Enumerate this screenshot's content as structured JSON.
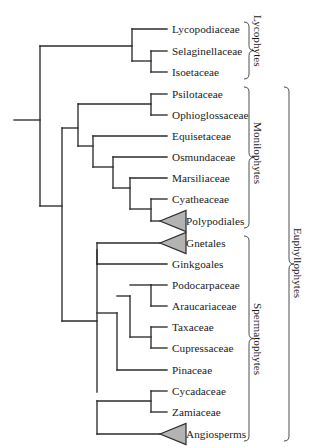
{
  "figure": {
    "type": "phylogenetic-cladogram",
    "background_color": "#ffffff",
    "line_color": "#2b2b2b",
    "triangle_fill": "#b3b3b3",
    "text_color": "#1a1a1a"
  },
  "tips": [
    {
      "label": "Lycopodiaceae",
      "y": 29,
      "x": 167,
      "terminal": "line",
      "clade": "Lycophytes"
    },
    {
      "label": "Selaginellaceae",
      "y": 51,
      "x": 167,
      "terminal": "line",
      "clade": "Lycophytes"
    },
    {
      "label": "Isoetaceae",
      "y": 72,
      "x": 167,
      "terminal": "line",
      "clade": "Lycophytes"
    },
    {
      "label": "Psilotaceae",
      "y": 94,
      "x": 167,
      "terminal": "line",
      "clade": "Monilophytes"
    },
    {
      "label": "Ophioglossaceae",
      "y": 115,
      "x": 167,
      "terminal": "line",
      "clade": "Monilophytes"
    },
    {
      "label": "Equisetaceae",
      "y": 136,
      "x": 167,
      "terminal": "line",
      "clade": "Monilophytes"
    },
    {
      "label": "Osmundaceae",
      "y": 157,
      "x": 167,
      "terminal": "line",
      "clade": "Monilophytes"
    },
    {
      "label": "Marsiliaceae",
      "y": 178,
      "x": 167,
      "terminal": "line",
      "clade": "Monilophytes"
    },
    {
      "label": "Cyatheaceae",
      "y": 199,
      "x": 167,
      "terminal": "line",
      "clade": "Monilophytes"
    },
    {
      "label": "Polypodiales",
      "y": 221,
      "x": 167,
      "terminal": "triangle",
      "clade": "Monilophytes"
    },
    {
      "label": "Gnetales",
      "y": 243,
      "x": 167,
      "terminal": "triangle",
      "clade": "Spermatophytes"
    },
    {
      "label": "Ginkgoales",
      "y": 264,
      "x": 167,
      "terminal": "line",
      "clade": "Spermatophytes"
    },
    {
      "label": "Podocarpaceae",
      "y": 285,
      "x": 167,
      "terminal": "line",
      "clade": "Spermatophytes"
    },
    {
      "label": "Araucariaceae",
      "y": 306,
      "x": 167,
      "terminal": "line",
      "clade": "Spermatophytes"
    },
    {
      "label": "Taxaceae",
      "y": 327,
      "x": 167,
      "terminal": "line",
      "clade": "Spermatophytes"
    },
    {
      "label": "Cupressaceae",
      "y": 348,
      "x": 167,
      "terminal": "line",
      "clade": "Spermatophytes"
    },
    {
      "label": "Pinaceae",
      "y": 370,
      "x": 167,
      "terminal": "line",
      "clade": "Spermatophytes"
    },
    {
      "label": "Cycadaceae",
      "y": 391,
      "x": 167,
      "terminal": "line",
      "clade": "Spermatophytes"
    },
    {
      "label": "Zamiaceae",
      "y": 412,
      "x": 167,
      "terminal": "line",
      "clade": "Spermatophytes"
    },
    {
      "label": "Angiosperms",
      "y": 434,
      "x": 167,
      "terminal": "triangle",
      "clade": "Spermatophytes"
    }
  ],
  "clade_brackets": [
    {
      "label": "Lycophytes",
      "top": 22,
      "bottom": 79,
      "x": 249
    },
    {
      "label": "Monilophytes",
      "top": 87,
      "bottom": 228,
      "x": 249
    },
    {
      "label": "Spermatophytes",
      "top": 236,
      "bottom": 441,
      "x": 249
    },
    {
      "label": "Euphyllophytes",
      "top": 87,
      "bottom": 441,
      "x": 289
    }
  ],
  "topology": {
    "root_stem": {
      "x1": 14,
      "x2": 40,
      "y": 120
    },
    "nodes": [
      {
        "name": "root",
        "x": 40,
        "y_top": 46,
        "y_bottom": 206
      },
      {
        "name": "lycophytes",
        "x": 132,
        "y_top": 29,
        "y_bottom": 61
      },
      {
        "name": "selag-isoet",
        "x": 151,
        "y_top": 51,
        "y_bottom": 72
      },
      {
        "name": "euphyllophytes",
        "x": 62,
        "y_top": 128,
        "y_bottom": 321
      },
      {
        "name": "monilophytes",
        "x": 78,
        "y_top": 104,
        "y_bottom": 146
      },
      {
        "name": "psilo-ophio",
        "x": 151,
        "y_top": 94,
        "y_bottom": 115
      },
      {
        "name": "equiset-ferns",
        "x": 93,
        "y_top": 136,
        "y_bottom": 167
      },
      {
        "name": "osmunda-core",
        "x": 113,
        "y_top": 157,
        "y_bottom": 188
      },
      {
        "name": "marsil-core",
        "x": 130,
        "y_top": 178,
        "y_bottom": 209
      },
      {
        "name": "cyathea-polypod",
        "x": 151,
        "y_top": 199,
        "y_bottom": 221
      },
      {
        "name": "spermatophytes",
        "x": 97,
        "y_top": 250,
        "y_bottom": 392
      },
      {
        "name": "gnet-ginkgo",
        "x": 97,
        "y_top": 243,
        "y_bottom": 264
      },
      {
        "name": "conifers",
        "x": 117,
        "y_top": 313,
        "y_bottom": 370
      },
      {
        "name": "podo-arauc-tax",
        "x": 130,
        "y_top": 296,
        "y_bottom": 337
      },
      {
        "name": "podo-arauc",
        "x": 151,
        "y_top": 285,
        "y_bottom": 306
      },
      {
        "name": "tax-cupress",
        "x": 151,
        "y_top": 327,
        "y_bottom": 348
      },
      {
        "name": "cycad-zamia",
        "x": 151,
        "y_top": 391,
        "y_bottom": 412
      },
      {
        "name": "cycads-angio",
        "x": 97,
        "y_top": 401,
        "y_bottom": 434
      }
    ]
  }
}
